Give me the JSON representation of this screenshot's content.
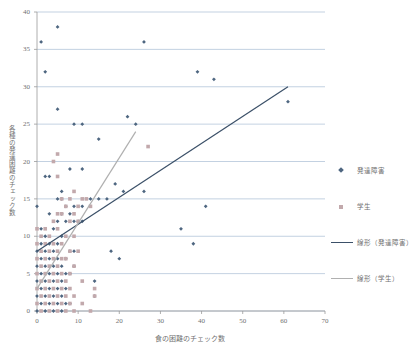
{
  "chart_data": {
    "type": "scatter",
    "title": "",
    "xlabel": "食の困難のチェック数",
    "ylabel": "各種の発達困難のチェック数",
    "xlim": [
      0,
      70
    ],
    "ylim": [
      0,
      40
    ],
    "xticks": [
      "0",
      "10",
      "20",
      "30",
      "40",
      "50",
      "60",
      "70"
    ],
    "yticks": [
      "0",
      "5",
      "10",
      "15",
      "20",
      "25",
      "30",
      "35",
      "40"
    ],
    "xtick_values": [
      0,
      10,
      20,
      30,
      40,
      50,
      60,
      70
    ],
    "ytick_values": [
      0,
      5,
      10,
      15,
      20,
      25,
      30,
      35,
      40
    ],
    "grid": "horizontal",
    "legend_position": "right",
    "colors": {
      "developmental": "#4e6680",
      "student": "#c2a9ac",
      "trend_developmental": "#3b5068",
      "trend_student": "#b0b0b0",
      "gridline": "#a9bdd4",
      "axis": "#9a9a9a",
      "text": "#707070"
    },
    "series": [
      {
        "name": "発達障害",
        "marker": "diamond",
        "color": "#4e6680",
        "points": [
          [
            1,
            36
          ],
          [
            5,
            38
          ],
          [
            26,
            36
          ],
          [
            2,
            32
          ],
          [
            39,
            32
          ],
          [
            43,
            31
          ],
          [
            61,
            28
          ],
          [
            5,
            27
          ],
          [
            22,
            26
          ],
          [
            11,
            25
          ],
          [
            24,
            25
          ],
          [
            9,
            25
          ],
          [
            15,
            23
          ],
          [
            8,
            19
          ],
          [
            11,
            19
          ],
          [
            2,
            18
          ],
          [
            3,
            18
          ],
          [
            6,
            16
          ],
          [
            19,
            17
          ],
          [
            21,
            16
          ],
          [
            26,
            16
          ],
          [
            17,
            15
          ],
          [
            5,
            15
          ],
          [
            6,
            15
          ],
          [
            13,
            15
          ],
          [
            15,
            15
          ],
          [
            0,
            14
          ],
          [
            7,
            14
          ],
          [
            9,
            14
          ],
          [
            11,
            14
          ],
          [
            41,
            14
          ],
          [
            3,
            13
          ],
          [
            6,
            13
          ],
          [
            8,
            13
          ],
          [
            5,
            12
          ],
          [
            7,
            12
          ],
          [
            9,
            12
          ],
          [
            10,
            12
          ],
          [
            11,
            12
          ],
          [
            35,
            11
          ],
          [
            1,
            11
          ],
          [
            4,
            11
          ],
          [
            6,
            10
          ],
          [
            2,
            10
          ],
          [
            1,
            9
          ],
          [
            3,
            9
          ],
          [
            5,
            9
          ],
          [
            38,
            9
          ],
          [
            0,
            8
          ],
          [
            2,
            8
          ],
          [
            4,
            8
          ],
          [
            8,
            8
          ],
          [
            9,
            8
          ],
          [
            18,
            8
          ],
          [
            1,
            7
          ],
          [
            3,
            7
          ],
          [
            5,
            7
          ],
          [
            7,
            7
          ],
          [
            20,
            7
          ],
          [
            0,
            6
          ],
          [
            2,
            6
          ],
          [
            4,
            6
          ],
          [
            6,
            6
          ],
          [
            9,
            6
          ],
          [
            1,
            5
          ],
          [
            3,
            5
          ],
          [
            5,
            5
          ],
          [
            7,
            5
          ],
          [
            8,
            5
          ],
          [
            0,
            4
          ],
          [
            2,
            4
          ],
          [
            4,
            4
          ],
          [
            6,
            4
          ],
          [
            14,
            4
          ],
          [
            1,
            3
          ],
          [
            3,
            3
          ],
          [
            5,
            3
          ],
          [
            7,
            3
          ],
          [
            0,
            2
          ],
          [
            2,
            2
          ],
          [
            4,
            2
          ],
          [
            6,
            2
          ],
          [
            14,
            2
          ],
          [
            1,
            1
          ],
          [
            3,
            1
          ],
          [
            5,
            1
          ],
          [
            7,
            1
          ],
          [
            8,
            1
          ],
          [
            0,
            0
          ],
          [
            2,
            0
          ],
          [
            4,
            0
          ],
          [
            6,
            0
          ]
        ]
      },
      {
        "name": "学生",
        "marker": "square",
        "color": "#c2a9ac",
        "points": [
          [
            5,
            21
          ],
          [
            4,
            20
          ],
          [
            5,
            18
          ],
          [
            9,
            16
          ],
          [
            27,
            22
          ],
          [
            6,
            15
          ],
          [
            8,
            15
          ],
          [
            11,
            15
          ],
          [
            12,
            15
          ],
          [
            7,
            14
          ],
          [
            10,
            14
          ],
          [
            13,
            14
          ],
          [
            5,
            13
          ],
          [
            6,
            13
          ],
          [
            9,
            13
          ],
          [
            4,
            12
          ],
          [
            8,
            12
          ],
          [
            10,
            12
          ],
          [
            0,
            11
          ],
          [
            2,
            11
          ],
          [
            5,
            11
          ],
          [
            1,
            10
          ],
          [
            3,
            10
          ],
          [
            7,
            10
          ],
          [
            9,
            10
          ],
          [
            0,
            9
          ],
          [
            2,
            9
          ],
          [
            4,
            9
          ],
          [
            6,
            9
          ],
          [
            1,
            8
          ],
          [
            3,
            8
          ],
          [
            5,
            8
          ],
          [
            8,
            8
          ],
          [
            10,
            8
          ],
          [
            0,
            7
          ],
          [
            2,
            7
          ],
          [
            4,
            7
          ],
          [
            6,
            7
          ],
          [
            7,
            7
          ],
          [
            1,
            6
          ],
          [
            3,
            6
          ],
          [
            5,
            6
          ],
          [
            9,
            6
          ],
          [
            0,
            5
          ],
          [
            2,
            5
          ],
          [
            4,
            5
          ],
          [
            6,
            5
          ],
          [
            8,
            5
          ],
          [
            1,
            4
          ],
          [
            3,
            4
          ],
          [
            5,
            4
          ],
          [
            7,
            4
          ],
          [
            11,
            4
          ],
          [
            0,
            3
          ],
          [
            2,
            3
          ],
          [
            4,
            3
          ],
          [
            6,
            3
          ],
          [
            8,
            3
          ],
          [
            14,
            3
          ],
          [
            1,
            2
          ],
          [
            3,
            2
          ],
          [
            5,
            2
          ],
          [
            7,
            2
          ],
          [
            9,
            2
          ],
          [
            14,
            2
          ],
          [
            0,
            1
          ],
          [
            2,
            1
          ],
          [
            4,
            1
          ],
          [
            6,
            1
          ],
          [
            8,
            1
          ],
          [
            11,
            1
          ],
          [
            1,
            0
          ],
          [
            3,
            0
          ],
          [
            5,
            0
          ],
          [
            7,
            0
          ],
          [
            9,
            0
          ],
          [
            13,
            0
          ]
        ]
      }
    ],
    "trendlines": [
      {
        "name": "線形（発達障害）",
        "color": "#3b5068",
        "x0": 0,
        "y0": 8.0,
        "x1": 61,
        "y1": 30.0
      },
      {
        "name": "線形（学生）",
        "color": "#b0b0b0",
        "x0": 0,
        "y0": 3.0,
        "x1": 24,
        "y1": 24.0
      }
    ]
  },
  "legend": {
    "entries": [
      {
        "label": "発達障害",
        "symbol": "diamond"
      },
      {
        "label": "学生",
        "symbol": "square"
      },
      {
        "label": "線形（発達障害）",
        "symbol": "line-dark"
      },
      {
        "label": "線形（学生）",
        "symbol": "line-gray"
      }
    ]
  }
}
